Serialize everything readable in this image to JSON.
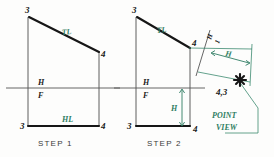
{
  "figure": {
    "colors": {
      "line_black": "#161616",
      "projector_gray": "#4c4c4c",
      "annotation_green": "#2f7d63",
      "background": "#fdfdfc"
    },
    "steps": [
      {
        "id": "step-1",
        "caption": "STEP  1",
        "vertex_labels": [
          {
            "name": "top-left",
            "text": "3"
          },
          {
            "name": "top-right",
            "text": "4"
          },
          {
            "name": "bottom-left",
            "text": "3"
          },
          {
            "name": "bottom-right",
            "text": "4"
          }
        ],
        "annotations": [
          {
            "name": "true-length-label",
            "text": "TL"
          },
          {
            "name": "horizontal-plane-label",
            "text": "H"
          },
          {
            "name": "frontal-plane-label",
            "text": "F"
          },
          {
            "name": "horizontal-line-label",
            "text": "HL"
          }
        ]
      },
      {
        "id": "step-2",
        "caption": "STEP  2",
        "vertex_labels": [
          {
            "name": "top-left",
            "text": "3"
          },
          {
            "name": "line-end-upper",
            "text": "4"
          },
          {
            "name": "bottom-left",
            "text": "3"
          },
          {
            "name": "bottom-right",
            "text": "4"
          }
        ],
        "annotations": [
          {
            "name": "true-length-label",
            "text": "TL"
          },
          {
            "name": "horizontal-plane-label",
            "text": "H"
          },
          {
            "name": "frontal-plane-label",
            "text": "F"
          },
          {
            "name": "height-dimension-label",
            "text": "H"
          },
          {
            "name": "aux-fold-upper-label",
            "text": "H"
          },
          {
            "name": "aux-fold-lower-label",
            "text": "1"
          },
          {
            "name": "aux-height-dimension-label",
            "text": "H"
          },
          {
            "name": "point-view-vertex-label",
            "text": "4,3"
          },
          {
            "name": "point-view-caption-line-1",
            "text": "POINT"
          },
          {
            "name": "point-view-caption-line-2",
            "text": "VIEW"
          }
        ]
      }
    ]
  }
}
